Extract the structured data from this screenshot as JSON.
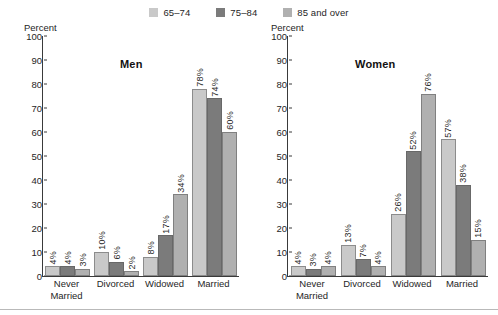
{
  "legend": {
    "items": [
      {
        "label": "65–74",
        "color": "#c9c9c9",
        "icon": "legend-swatch-icon"
      },
      {
        "label": "75–84",
        "color": "#7b7b7b",
        "icon": "legend-swatch-icon"
      },
      {
        "label": "85 and over",
        "color": "#b0b0b0",
        "icon": "legend-swatch-icon"
      }
    ]
  },
  "panels": [
    {
      "title": "Men",
      "axis_caption": "Percent"
    },
    {
      "title": "Women",
      "axis_caption": "Percent"
    }
  ],
  "yticks": [
    "0",
    "10",
    "20",
    "30",
    "40",
    "50",
    "60",
    "70",
    "80",
    "90",
    "100"
  ],
  "categories": [
    "Never Married",
    "Divorced",
    "Widowed",
    "Married"
  ],
  "category_lines": [
    [
      "Never",
      "Married"
    ],
    [
      "Divorced"
    ],
    [
      "Widowed"
    ],
    [
      "Married"
    ]
  ],
  "chart_data": [
    {
      "type": "bar",
      "title": "Men",
      "xlabel": "",
      "ylabel": "Percent",
      "ylim": [
        0,
        100
      ],
      "ytick_step": 10,
      "grid": false,
      "legend_position": "top-center",
      "categories": [
        "Never Married",
        "Divorced",
        "Widowed",
        "Married"
      ],
      "series": [
        {
          "name": "65–74",
          "color": "#c9c9c9",
          "values": [
            4,
            10,
            8,
            78
          ],
          "labels": [
            "4%",
            "10%",
            "8%",
            "78%"
          ]
        },
        {
          "name": "75–84",
          "color": "#7b7b7b",
          "values": [
            4,
            6,
            17,
            74
          ],
          "labels": [
            "4%",
            "6%",
            "17%",
            "74%"
          ]
        },
        {
          "name": "85 and over",
          "color": "#b0b0b0",
          "values": [
            3,
            2,
            34,
            60
          ],
          "labels": [
            "3%",
            "2%",
            "34%",
            "60%"
          ]
        }
      ]
    },
    {
      "type": "bar",
      "title": "Women",
      "xlabel": "",
      "ylabel": "Percent",
      "ylim": [
        0,
        100
      ],
      "ytick_step": 10,
      "grid": false,
      "legend_position": "top-center",
      "categories": [
        "Never Married",
        "Divorced",
        "Widowed",
        "Married"
      ],
      "series": [
        {
          "name": "65–74",
          "color": "#c9c9c9",
          "values": [
            4,
            13,
            26,
            57
          ],
          "labels": [
            "4%",
            "13%",
            "26%",
            "57%"
          ]
        },
        {
          "name": "75–84",
          "color": "#7b7b7b",
          "values": [
            3,
            7,
            52,
            38
          ],
          "labels": [
            "3%",
            "7%",
            "52%",
            "38%"
          ]
        },
        {
          "name": "85 and over",
          "color": "#b0b0b0",
          "values": [
            4,
            4,
            76,
            15
          ],
          "labels": [
            "4%",
            "4%",
            "76%",
            "15%"
          ]
        }
      ]
    }
  ]
}
